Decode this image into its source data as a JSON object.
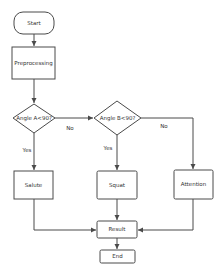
{
  "diagram": {
    "type": "flowchart",
    "nodes": [
      {
        "id": "start",
        "shape": "terminal",
        "label": "Start"
      },
      {
        "id": "pre",
        "shape": "process",
        "label": "Preprocessing"
      },
      {
        "id": "decA",
        "shape": "decision",
        "label": "Angle A<90?"
      },
      {
        "id": "decB",
        "shape": "decision",
        "label": "Angle B<90?"
      },
      {
        "id": "salute",
        "shape": "process",
        "label": "Salute"
      },
      {
        "id": "squat",
        "shape": "process",
        "label": "Squat"
      },
      {
        "id": "attention",
        "shape": "process",
        "label": "Attention"
      },
      {
        "id": "result",
        "shape": "process",
        "label": "Result"
      },
      {
        "id": "end",
        "shape": "process",
        "label": "End"
      }
    ],
    "edges": [
      {
        "from": "start",
        "to": "pre",
        "label": ""
      },
      {
        "from": "pre",
        "to": "decA",
        "label": ""
      },
      {
        "from": "decA",
        "to": "decB",
        "label": "No"
      },
      {
        "from": "decA",
        "to": "salute",
        "label": "Yes"
      },
      {
        "from": "decB",
        "to": "squat",
        "label": "Yes"
      },
      {
        "from": "decB",
        "to": "attention",
        "label": "No"
      },
      {
        "from": "salute",
        "to": "result",
        "label": ""
      },
      {
        "from": "squat",
        "to": "result",
        "label": ""
      },
      {
        "from": "attention",
        "to": "result",
        "label": ""
      },
      {
        "from": "result",
        "to": "end",
        "label": ""
      }
    ]
  },
  "colors": {
    "stroke": "#4a4a4a",
    "fill": "#ffffff",
    "text": "#333333"
  }
}
